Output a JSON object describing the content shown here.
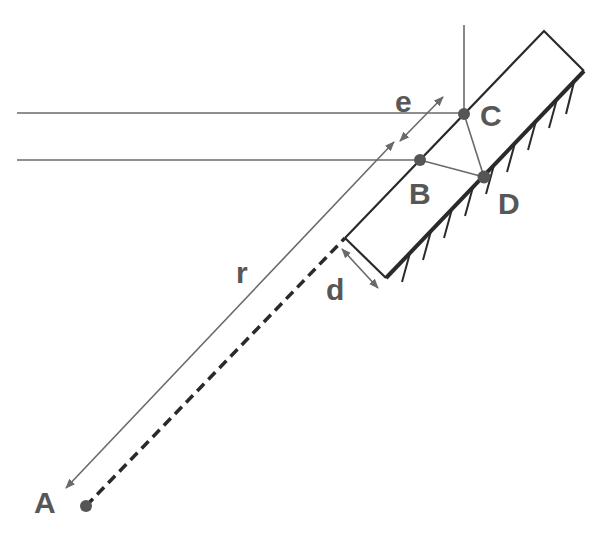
{
  "diagram": {
    "labels": {
      "A": "A",
      "B": "B",
      "C": "C",
      "D": "D",
      "r": "r",
      "e": "e",
      "d": "d"
    },
    "colors": {
      "thin_line": "#6a6a6a",
      "thick_line": "#2a2a2a",
      "point": "#555555",
      "label": "#575757",
      "background": "#ffffff"
    },
    "points": {
      "A": [
        86,
        506
      ],
      "B": [
        420,
        160
      ],
      "C": [
        464,
        114
      ],
      "D": [
        484,
        177
      ]
    },
    "slab": {
      "corners": [
        [
          345,
          238
        ],
        [
          544,
          31
        ],
        [
          584,
          71
        ],
        [
          386,
          278
        ]
      ],
      "hatched_side": "lower-right (surface)"
    }
  }
}
